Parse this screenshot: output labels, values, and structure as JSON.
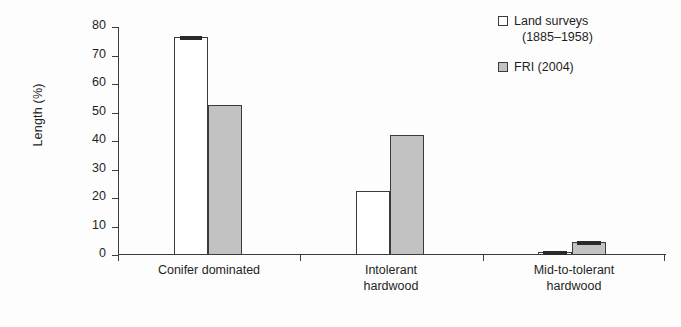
{
  "chart_data": {
    "type": "bar",
    "title": "",
    "xlabel": "",
    "ylabel": "Length (%)",
    "ylim": [
      0,
      80
    ],
    "yticks": [
      0,
      10,
      20,
      30,
      40,
      50,
      60,
      70,
      80
    ],
    "grid": false,
    "legend_position": "top-right",
    "categories": [
      "Conifer dominated",
      "Intolerant hardwood",
      "Mid-to-tolerant hardwood"
    ],
    "series": [
      {
        "name": "Land surveys (1885–1958)",
        "color": "#ffffff",
        "values": [
          76.5,
          22.5,
          1.0
        ]
      },
      {
        "name": "FRI (2004)",
        "color": "#c2c2c2",
        "values": [
          52.5,
          42.0,
          4.5
        ]
      }
    ],
    "error_bars": [
      {
        "category": "Conifer dominated",
        "series": "Land surveys (1885–1958)",
        "present": true
      },
      {
        "category": "Mid-to-tolerant hardwood",
        "series": "Land surveys (1885–1958)",
        "present": true
      },
      {
        "category": "Mid-to-tolerant hardwood",
        "series": "FRI (2004)",
        "present": true
      }
    ]
  },
  "axis": {
    "y_title": "Length (%)",
    "y_tick_labels": [
      "80",
      "70",
      "60",
      "50",
      "40",
      "30",
      "20",
      "10",
      "0"
    ]
  },
  "categories": [
    {
      "line1": "Conifer dominated",
      "line2": ""
    },
    {
      "line1": "Intolerant",
      "line2": "hardwood"
    },
    {
      "line1": "Mid-to-tolerant",
      "line2": "hardwood"
    }
  ],
  "legend": {
    "entries": [
      {
        "line1": "Land surveys",
        "line2": "(1885–1958)",
        "swatch": "white-square-swatch"
      },
      {
        "line1": "FRI (2004)",
        "line2": "",
        "swatch": "gray-square-swatch"
      }
    ]
  },
  "colors": {
    "series_a_fill": "#ffffff",
    "series_b_fill": "#c2c2c2",
    "outline": "#3a3a3a",
    "background": "#fdfdfd"
  }
}
